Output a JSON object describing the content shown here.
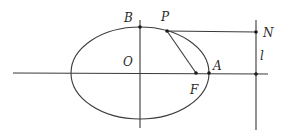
{
  "diagram": {
    "type": "ellipse-geometry",
    "labels": {
      "B": "B",
      "P": "P",
      "N": "N",
      "O": "O",
      "A": "A",
      "F": "F",
      "l": "l"
    },
    "colors": {
      "stroke": "#3a3a3a",
      "point": "#1a1a1a",
      "background": "#ffffff"
    }
  }
}
